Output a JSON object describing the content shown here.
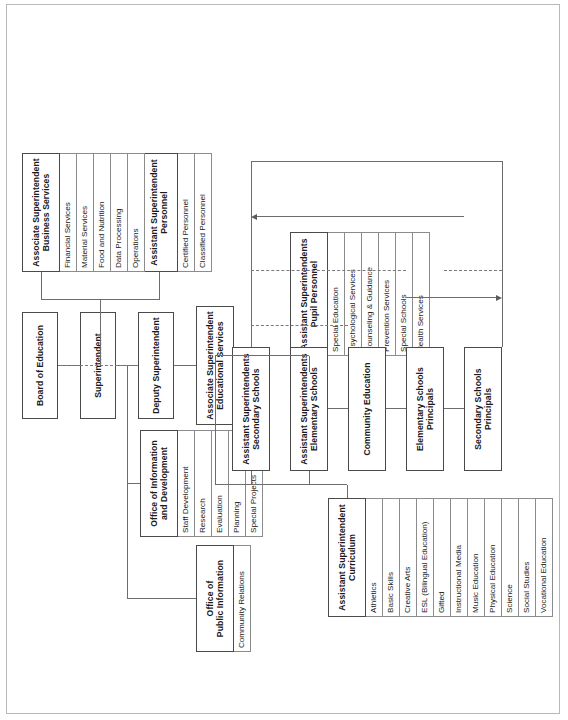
{
  "chart": {
    "type": "org-chart",
    "orientation": "rotated-90-ccw",
    "nodes": {
      "board": {
        "label": "Board of Education"
      },
      "superintendent": {
        "label": "Superintendent"
      },
      "deputy": {
        "label": "Deputy Superintendent"
      },
      "public_information": {
        "label": "Office of\nPublic Information",
        "line1": "Office of",
        "line2": "Public Information",
        "children": [
          "Community Relations"
        ]
      },
      "info_development": {
        "label": "Office of Information\nand Development",
        "line1": "Office of Information",
        "line2": "and Development",
        "children": [
          "Staff Development",
          "Research",
          "Evaluation",
          "Planning",
          "Special Projects"
        ]
      },
      "educational_services": {
        "line1": "Associate Superintendent",
        "line2": "Educational Services"
      },
      "personnel": {
        "line1": "Assistant Superintendent",
        "line2": "Personnel",
        "children": [
          "Certified Personnel",
          "Classified Personnel"
        ]
      },
      "business_services": {
        "line1": "Associate Superintendent",
        "line2": "Business Services",
        "children": [
          "Financial Services",
          "Material Services",
          "Food and Nutrition",
          "Data Processing",
          "Operations"
        ]
      },
      "pupil_personnel": {
        "line1": "Assistant Superintendents",
        "line2": "Pupil Personnel",
        "children": [
          "Special Education",
          "Psychological Services",
          "Counseling & Guidance",
          "Prevention Services",
          "Special Schools",
          "Health Services"
        ]
      },
      "curriculum": {
        "line1": "Assistant Superintendent",
        "line2": "Curriculum",
        "children": [
          "Athletics",
          "Basic Skills",
          "Creative Arts",
          "ESL (Bilingual Education)",
          "Gifted",
          "Instructional Media",
          "Music Education",
          "Physical Education",
          "Science",
          "Social Studies",
          "Vocational Education"
        ]
      },
      "elementary_schools": {
        "line1": "Assistant Superintendents",
        "line2": "Elementary Schools"
      },
      "secondary_schools": {
        "line1": "Assistant Superintendents",
        "line2": "Secondary Schools"
      },
      "community_education": {
        "label": "Community Education"
      },
      "elementary_principals": {
        "line1": "Elementary Schools",
        "line2": "Principals"
      },
      "secondary_principals": {
        "line1": "Secondary Schools",
        "line2": "Principals"
      }
    },
    "colors": {
      "box_border": "#4a4a4a",
      "leaf_border": "#8c8c8c",
      "connector": "#6d6d6d",
      "background": "#ffffff",
      "text": "#1a1a1a"
    }
  }
}
